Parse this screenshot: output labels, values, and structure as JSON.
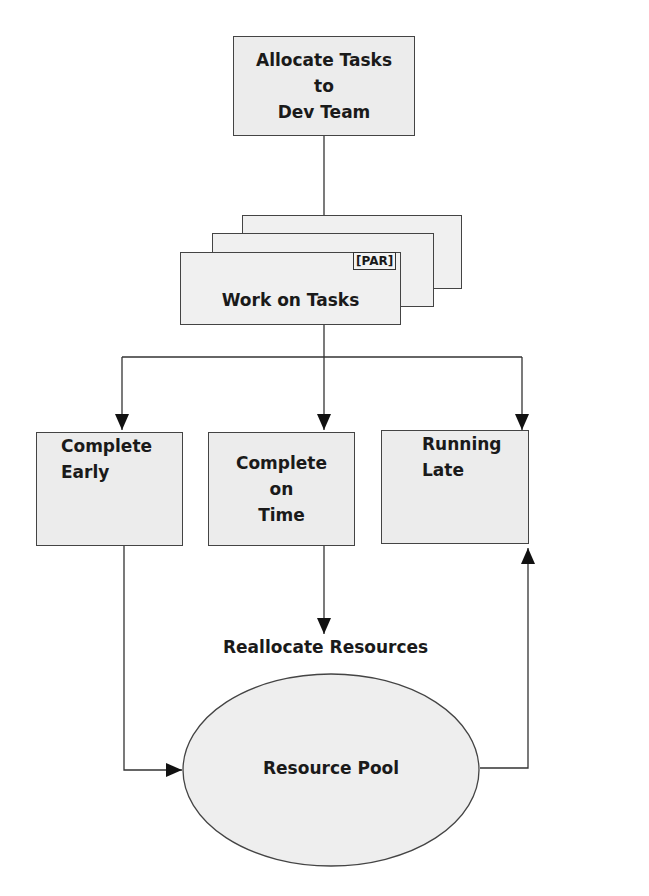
{
  "diagram": {
    "nodes": {
      "allocate": {
        "line1": "Allocate Tasks",
        "line2": "to",
        "line3": "Dev Team"
      },
      "work": {
        "label": "Work on Tasks",
        "badge": "[PAR]"
      },
      "early": {
        "line1": "Complete",
        "line2": "Early"
      },
      "ontime": {
        "line1": "Complete",
        "line2": "on",
        "line3": "Time"
      },
      "late": {
        "line1": "Running",
        "line2": "Late"
      },
      "pool": {
        "label": "Resource Pool"
      }
    },
    "edge_labels": {
      "reallocate": "Reallocate Resources"
    },
    "colors": {
      "box_fill": "#ececec",
      "stroke": "#444444",
      "ellipse_fill": "#eeeeee"
    }
  }
}
